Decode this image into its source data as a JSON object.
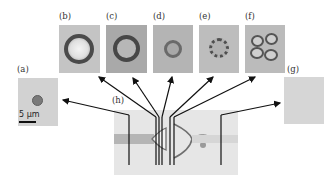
{
  "figure": {
    "panels": [
      {
        "id": "a",
        "label": "(a)",
        "description": "small stained cell"
      },
      {
        "id": "b",
        "label": "(b)",
        "description": "large ring-shaped cell"
      },
      {
        "id": "c",
        "label": "(c)",
        "description": "ring-shaped cell"
      },
      {
        "id": "d",
        "label": "(d)",
        "description": "small ring-shaped cell"
      },
      {
        "id": "e",
        "label": "(e)",
        "description": "fragmented ring of lobes"
      },
      {
        "id": "f",
        "label": "(f)",
        "description": "multi-lobed cell cluster"
      },
      {
        "id": "g",
        "label": "(g)",
        "description": "empty field"
      },
      {
        "id": "h",
        "label": "(h)",
        "description": "microfluidic channel overview"
      }
    ],
    "scale_bar": {
      "text": "5 µm"
    }
  }
}
